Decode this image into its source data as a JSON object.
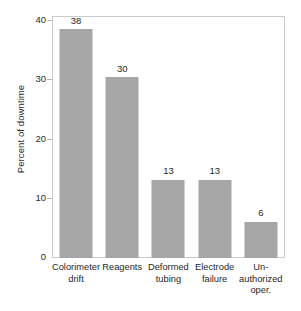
{
  "chart_data": {
    "type": "bar",
    "title": "",
    "subtitle": "",
    "xlabel": "",
    "ylabel": "Percent of downtime",
    "ylim": [
      0,
      40
    ],
    "yticks": [
      0,
      10,
      20,
      30,
      40
    ],
    "ytick_labels": [
      "0",
      "10",
      "20",
      "30",
      "40"
    ],
    "grid": false,
    "legend": null,
    "bar_color": "#a6a6a6",
    "frame_color": "#c9c9c9",
    "text_color": "#1f1f1f",
    "show_value_labels": true,
    "categories": [
      "Colorimeter drift",
      "Reagents",
      "Deformed tubing",
      "Electrode failure",
      "Un-authorized oper."
    ],
    "category_lines": [
      [
        "Colorimeter",
        "drift"
      ],
      [
        "Reagents"
      ],
      [
        "Deformed",
        "tubing"
      ],
      [
        "Electrode",
        "failure"
      ],
      [
        "Un-",
        "authorized",
        "oper."
      ]
    ],
    "values": [
      38,
      30,
      13,
      13,
      6
    ],
    "value_labels": [
      "38",
      "30",
      "13",
      "13",
      "6"
    ]
  }
}
